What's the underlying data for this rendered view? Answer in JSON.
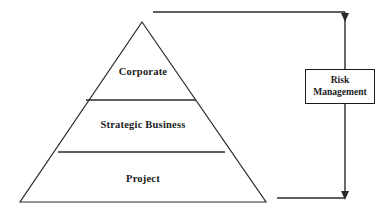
{
  "diagram": {
    "type": "pyramid-with-feedback-loop",
    "colors": {
      "stroke": "#2a2a2a",
      "text": "#1b1b1b",
      "background": "#ffffff"
    },
    "pyramid": {
      "name": "management-hierarchy-pyramid",
      "apex": {
        "x": 142,
        "y": 22
      },
      "base_left": {
        "x": 20,
        "y": 202
      },
      "base_right": {
        "x": 266,
        "y": 202
      },
      "tiers": [
        {
          "label": "Corporate",
          "level": 1
        },
        {
          "label": "Strategic Business",
          "level": 2
        },
        {
          "label": "Project",
          "level": 3
        }
      ],
      "dividers": [
        {
          "y": 100,
          "x1": 86,
          "x2": 196
        },
        {
          "y": 152,
          "x1": 58,
          "x2": 225
        }
      ]
    },
    "side_box": {
      "name": "risk-management-box",
      "lines": [
        "Risk",
        "Management"
      ],
      "x": 305,
      "y": 69,
      "width": 70,
      "height": 35
    },
    "connectors": {
      "top_line": {
        "x1": 153,
        "y": 12,
        "x2": 345
      },
      "bottom_line": {
        "x1": 277,
        "y": 198,
        "x2": 345
      },
      "vertical_line": {
        "x": 345,
        "y1": 12,
        "y2": 198
      },
      "arrowheads": [
        {
          "name": "arrowhead-top",
          "x": 345,
          "y": 20,
          "direction": "down"
        },
        {
          "name": "arrowhead-bottom",
          "x": 345,
          "y": 198,
          "direction": "down"
        }
      ]
    }
  }
}
